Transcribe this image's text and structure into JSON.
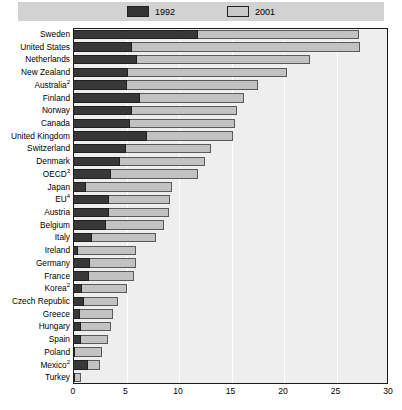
{
  "legend": {
    "items": [
      {
        "label": "1992",
        "color": "#383838",
        "name": "legend-1992"
      },
      {
        "label": "2001",
        "color": "#c2c2c2",
        "name": "legend-2001"
      }
    ]
  },
  "axis": {
    "ticks": [
      "0",
      "5",
      "10",
      "15",
      "20",
      "25",
      "30"
    ]
  },
  "chart_data": {
    "type": "bar",
    "orientation": "horizontal",
    "title": "",
    "subtitle": "",
    "xlabel": "",
    "ylabel": "",
    "xlim": [
      0,
      30
    ],
    "xticks": [
      0,
      5,
      10,
      15,
      20,
      25,
      30
    ],
    "grid": true,
    "legend_position": "top-center",
    "categories": [
      "Sweden",
      "United States",
      "Netherlands",
      "New Zealand",
      "Australia²",
      "Finland",
      "Norway",
      "Canada",
      "United Kingdom",
      "Switzerland",
      "Denmark",
      "OECD³",
      "Japan",
      "EU⁴",
      "Austria",
      "Belgium",
      "Italy",
      "Ireland",
      "Germany",
      "France",
      "Korea²",
      "Czech Republic",
      "Greece",
      "Hungary",
      "Spain",
      "Poland",
      "Mexico²",
      "Turkey"
    ],
    "series": [
      {
        "name": "1992",
        "color": "#383838",
        "values": [
          11.9,
          5.6,
          6.1,
          5.2,
          5.1,
          6.4,
          5.6,
          5.4,
          7.0,
          5.0,
          4.5,
          3.6,
          1.2,
          3.4,
          3.4,
          3.1,
          1.8,
          0.5,
          1.6,
          1.5,
          0.9,
          1.0,
          0.7,
          0.8,
          0.8,
          0.1,
          1.4,
          0.1
        ],
        "label": "1992"
      },
      {
        "name": "2001",
        "color": "#c2c2c2",
        "values": [
          27.2,
          27.3,
          22.6,
          20.4,
          17.6,
          16.3,
          15.6,
          15.4,
          15.2,
          13.1,
          12.6,
          11.9,
          9.4,
          9.2,
          9.1,
          8.7,
          7.9,
          6.0,
          6.0,
          5.8,
          5.1,
          4.3,
          3.8,
          3.6,
          3.3,
          2.8,
          2.6,
          0.8
        ],
        "label": "2001"
      }
    ]
  }
}
